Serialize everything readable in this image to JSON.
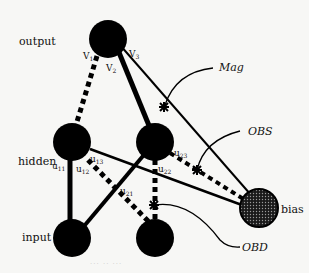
{
  "diagram": {
    "layer_labels": {
      "output": "output",
      "hidden": "hidden",
      "input": "input",
      "bias": "bias"
    },
    "weight_labels": {
      "v1": {
        "base": "V",
        "sub": "1"
      },
      "v2": {
        "base": "V",
        "sub": "2"
      },
      "v3": {
        "base": "V",
        "sub": "3"
      },
      "u11": {
        "base": "u",
        "sub": "11"
      },
      "u12": {
        "base": "u",
        "sub": "12"
      },
      "u13": {
        "base": "u",
        "sub": "13"
      },
      "u21": {
        "base": "u",
        "sub": "21"
      },
      "u22": {
        "base": "u",
        "sub": "22"
      },
      "u23": {
        "base": "u",
        "sub": "23"
      }
    },
    "annotations": {
      "mag": "Mag",
      "obs": "OBS",
      "obd": "OBD"
    },
    "caption": "··· ·· ···",
    "colors": {
      "node": "#000000",
      "background": "#f7f7f5",
      "bias_fill": "#3a3a3a"
    }
  }
}
